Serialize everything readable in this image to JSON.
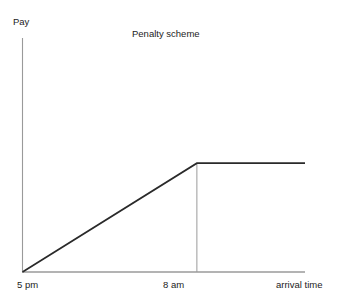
{
  "chart_data": {
    "type": "line",
    "title": "Penalty scheme",
    "xlabel": "arrival time",
    "ylabel": "Pay",
    "grid": false,
    "legend": false,
    "x_tick_labels": [
      "5 pm",
      "8 am"
    ],
    "x_tick_positions": [
      0,
      1
    ],
    "y_tick_labels": [],
    "xlim": [
      0,
      1.62
    ],
    "ylim": [
      0,
      1
    ],
    "annotations": [
      {
        "name": "kink-dropline",
        "type": "vertical-line",
        "x": 1,
        "y_from": 0,
        "y_to": 0.465,
        "color": "#9a9a9a"
      }
    ],
    "series": [
      {
        "name": "pay",
        "color": "#2a2a2a",
        "x": [
          0,
          1,
          1.62
        ],
        "y": [
          0,
          0.465,
          0.465
        ],
        "description": "Pay rises linearly from zero at 5 pm to a maximum at 8 am, then stays flat."
      }
    ],
    "axis_color": "#9a9a9a",
    "background_color": "#ffffff"
  },
  "chart": {
    "title": "Penalty scheme",
    "y_axis_label": "Pay",
    "x_axis_label": "arrival time",
    "tick_5pm": "5 pm",
    "tick_8am": "8 am"
  }
}
